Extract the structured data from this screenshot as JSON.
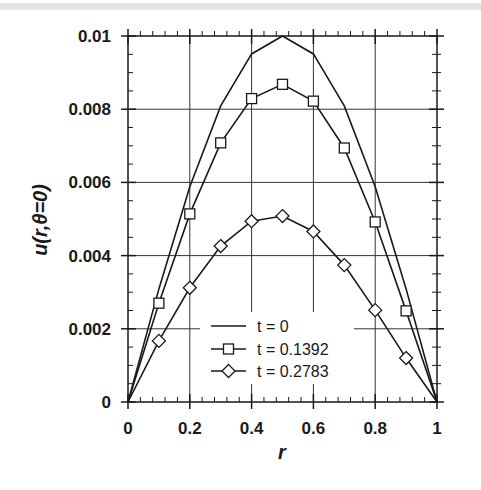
{
  "chart_data": {
    "type": "line",
    "title": "",
    "xlabel": "r",
    "ylabel": "u(r,θ=0)",
    "xlim": [
      0,
      1
    ],
    "ylim": [
      0,
      0.01
    ],
    "grid": true,
    "legend_position": "lower center (inside plot)",
    "x_ticks": [
      0,
      0.2,
      0.4,
      0.6,
      0.8,
      1
    ],
    "x_tick_labels": [
      "0",
      "0.2",
      "0.4",
      "0.6",
      "0.8",
      "1"
    ],
    "y_ticks": [
      0,
      0.002,
      0.004,
      0.006,
      0.008,
      0.01
    ],
    "y_tick_labels": [
      "0",
      "0.002",
      "0.004",
      "0.006",
      "0.008",
      "0.01"
    ],
    "x": [
      0,
      0.1,
      0.2,
      0.3,
      0.4,
      0.5,
      0.6,
      0.7,
      0.8,
      0.9,
      1.0
    ],
    "series": [
      {
        "name": "t = 0",
        "marker": "none",
        "values": [
          0,
          0.00309,
          0.00588,
          0.00809,
          0.00951,
          0.01,
          0.00951,
          0.00809,
          0.00588,
          0.00309,
          0
        ]
      },
      {
        "name": "t = 0.1392",
        "marker": "square",
        "values": [
          0,
          0.0027,
          0.00514,
          0.00708,
          0.00829,
          0.00868,
          0.00822,
          0.00694,
          0.00492,
          0.00249,
          0
        ]
      },
      {
        "name": "t = 0.2783",
        "marker": "diamond",
        "values": [
          0,
          0.00167,
          0.00312,
          0.00426,
          0.00494,
          0.00508,
          0.00466,
          0.00374,
          0.00251,
          0.0012,
          0
        ]
      }
    ]
  },
  "legend": {
    "items": [
      {
        "label": "t = 0",
        "marker": "line-icon"
      },
      {
        "label": "t = 0.1392",
        "marker": "square-marker-icon"
      },
      {
        "label": "t = 0.2783",
        "marker": "diamond-marker-icon"
      }
    ]
  },
  "axes": {
    "x_title": "r",
    "y_title": "u(r,θ=0)"
  }
}
